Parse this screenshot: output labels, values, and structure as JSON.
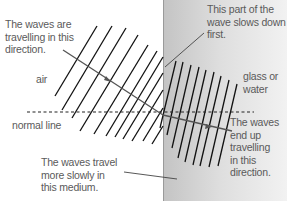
{
  "labels": {
    "incident_direction": "The waves are\ntravelling in this\ndirection.",
    "slows_first": "This part of the\nwave slows down\nfirst.",
    "air": "air",
    "glass_or_water": "glass or\nwater",
    "normal_line": "normal line",
    "travel_slowly": "The waves travel\nmore slowly in\nthis medium.",
    "refracted_direction": "The waves\nend up\ntravelling\nin this\ndirection."
  },
  "colors": {
    "wavefront": "#111111",
    "ray": "#555555",
    "normal": "#222222",
    "glass_left": "#c4c4c4",
    "glass_right": "#f2f2f2",
    "text": "#5a5a5a"
  }
}
